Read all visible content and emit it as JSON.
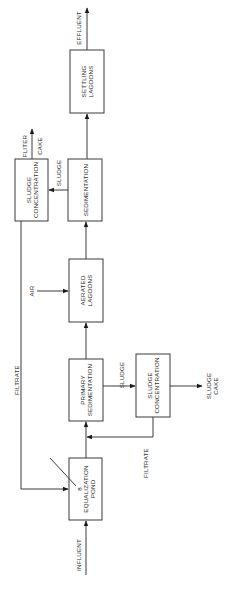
{
  "diagram": {
    "type": "process-flow",
    "orientation": "rotated-90-ccw",
    "nodes": {
      "equalization_pond": {
        "line1": "EQUALIZATION",
        "line2": "POND",
        "marker": "8"
      },
      "primary_sedimentation": {
        "line1": "PRIMARY",
        "line2": "SEDIMENTATION"
      },
      "sludge_concentration_1": {
        "line1": "SLUDGE",
        "line2": "CONCENTRATION"
      },
      "aerated_lagoons": {
        "line1": "AERATED",
        "line2": "LAGOONS"
      },
      "sedimentation": {
        "line1": "SEDIMENTATION"
      },
      "sludge_concentration_2": {
        "line1": "SLUDGE",
        "line2": "CONCENTRATION"
      },
      "settling_lagoons": {
        "line1": "SETTLING",
        "line2": "LAGOONS"
      }
    },
    "labels": {
      "influent": "INFLUENT",
      "effluent": "EFFLUENT",
      "air": "AIR",
      "sludge_primary": "SLUDGE",
      "sludge_secondary": "SLUDGE",
      "sludge_cake_line1": "SLUDGE",
      "sludge_cake_line2": "CAKE",
      "filter_cake_line1": "FLITER",
      "filter_cake_line2": "CAKE",
      "filtrate_long": "FILTRATE",
      "filtrate_short": "FILTRATE"
    },
    "edges": [
      {
        "from": "INFLUENT",
        "to": "EQUALIZATION POND"
      },
      {
        "from": "EQUALIZATION POND",
        "to": "PRIMARY SEDIMENTATION"
      },
      {
        "from": "PRIMARY SEDIMENTATION",
        "to": "SLUDGE CONCENTRATION (lower)",
        "label": "SLUDGE"
      },
      {
        "from": "SLUDGE CONCENTRATION (lower)",
        "to": "SLUDGE CAKE"
      },
      {
        "from": "SLUDGE CONCENTRATION (lower)",
        "to": "PRIMARY SEDIMENTATION inlet",
        "label": "FILTRATE"
      },
      {
        "from": "PRIMARY SEDIMENTATION",
        "to": "AERATED LAGOONS"
      },
      {
        "from": "AIR",
        "to": "AERATED LAGOONS"
      },
      {
        "from": "AERATED LAGOONS",
        "to": "SEDIMENTATION"
      },
      {
        "from": "SEDIMENTATION",
        "to": "SLUDGE CONCENTRATION (upper)",
        "label": "SLUDGE"
      },
      {
        "from": "SLUDGE CONCENTRATION (upper)",
        "to": "FLITER CAKE"
      },
      {
        "from": "SLUDGE CONCENTRATION (upper)",
        "to": "EQUALIZATION POND",
        "label": "FILTRATE"
      },
      {
        "from": "SEDIMENTATION",
        "to": "SETTLING LAGOONS"
      },
      {
        "from": "SETTLING LAGOONS",
        "to": "EFFLUENT"
      }
    ]
  }
}
